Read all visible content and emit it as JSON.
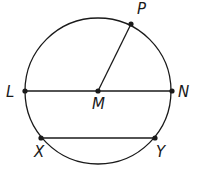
{
  "diagram": {
    "type": "circle-geometry",
    "circle": {
      "center": "M",
      "cx": 98,
      "cy": 91,
      "r": 73
    },
    "points": [
      {
        "name": "P",
        "x": 131,
        "y": 24,
        "label_x": 137,
        "label_y": 14
      },
      {
        "name": "L",
        "x": 25,
        "y": 91,
        "label_x": 6,
        "label_y": 97
      },
      {
        "name": "M",
        "x": 98,
        "y": 91,
        "label_x": 92,
        "label_y": 109
      },
      {
        "name": "N",
        "x": 172,
        "y": 91,
        "label_x": 178,
        "label_y": 97
      },
      {
        "name": "X",
        "x": 41,
        "y": 138,
        "label_x": 34,
        "label_y": 157
      },
      {
        "name": "Y",
        "x": 155,
        "y": 138,
        "label_x": 156,
        "label_y": 157
      }
    ],
    "segments": [
      {
        "name": "LN",
        "from": "L",
        "to": "N"
      },
      {
        "name": "MP",
        "from": "M",
        "to": "P"
      },
      {
        "name": "XY",
        "from": "X",
        "to": "Y"
      }
    ],
    "colors": {
      "stroke": "#1a1a1a",
      "background": "#ffffff"
    }
  }
}
